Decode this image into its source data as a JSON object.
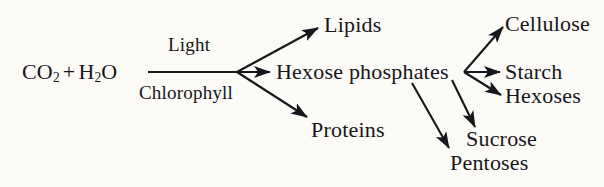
{
  "diagram": {
    "ink_color": "#17161a",
    "background_color": "#fbfaf6",
    "reactants": {
      "co2": "CO",
      "co2_sub": "2",
      "plus": "+",
      "h2o": "H",
      "h2o_sub": "2",
      "h2o_tail": "O"
    },
    "conditions": {
      "above": "Light",
      "below": "Chlorophyll"
    },
    "products": {
      "lipids": "Lipids",
      "hexose_phosphates": "Hexose phosphates",
      "proteins": "Proteins",
      "cellulose": "Cellulose",
      "starch": "Starch",
      "hexoses": "Hexoses",
      "sucrose": "Sucrose",
      "pentoses": "Pentoses"
    }
  }
}
